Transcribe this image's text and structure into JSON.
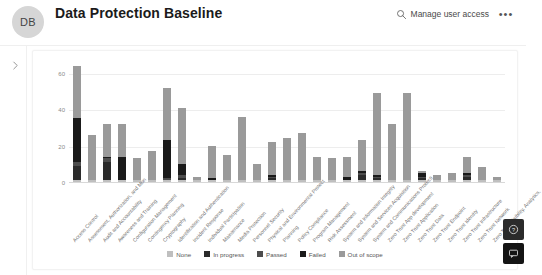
{
  "header": {
    "avatar_initials": "DB",
    "title": "Data Protection Baseline",
    "manage_access_label": "Manage user access",
    "manage_access_icon": "search-icon",
    "more_label": "•••"
  },
  "rail": {
    "expand_icon": "chevron-right-icon"
  },
  "floating": {
    "help_icon": "help-icon",
    "feedback_icon": "feedback-icon"
  },
  "colors": {
    "none": "#bfbfbf",
    "in_progress": "#2b2b2b",
    "passed": "#4d4d4d",
    "failed": "#1a1a1a",
    "out_of_scope": "#9a9a9a",
    "grid": "#ededed",
    "axis": "#d8d8d8",
    "text": "#6f6f6f"
  },
  "chart_data": {
    "type": "bar",
    "subtype": "stacked",
    "title": "",
    "xlabel": "",
    "ylabel": "",
    "ylim": [
      0,
      65
    ],
    "yticks": [
      0,
      20,
      40,
      60
    ],
    "grid": true,
    "legend_position": "bottom",
    "legend": [
      "None",
      "In progress",
      "Passed",
      "Failed",
      "Out of scope"
    ],
    "categories": [
      "Access Control",
      "Assessment, Authorization, and Monitoring",
      "Audit and Accountability",
      "Awareness and Training",
      "Configuration Management",
      "Contingency Planning",
      "Cryptography",
      "Identification and Authentication",
      "Incident Response",
      "Individual Participation",
      "Maintenance",
      "Media Protection",
      "Personnel Security",
      "Physical and Environmental Protection",
      "Planning",
      "Policy Compliance",
      "Program Management",
      "Risk Assessment",
      "System and Information Integrity",
      "System and Services Acquisition",
      "System and Communications Protection",
      "Zero Trust App development",
      "Zero Trust Application",
      "Zero Trust Data",
      "Zero Trust Endpoint",
      "Zero Trust Identity",
      "Zero Trust Infrastructure",
      "Zero Trust Network",
      "Zero Trust Visibility, Analytics, and Automation"
    ],
    "series": [
      {
        "name": "None",
        "color": "#bfbfbf",
        "values": [
          1,
          1,
          1,
          1,
          1,
          1,
          1,
          1,
          1,
          1,
          1,
          1,
          1,
          1,
          1,
          1,
          1,
          1,
          1,
          1,
          1,
          1,
          1,
          1,
          1,
          1,
          1,
          1,
          1
        ]
      },
      {
        "name": "In progress",
        "color": "#2b2b2b",
        "values": [
          8,
          0,
          10,
          0,
          0,
          0,
          0,
          1,
          0,
          0,
          0,
          0,
          0,
          1,
          0,
          0,
          0,
          0,
          0,
          3,
          1,
          0,
          0,
          1,
          0,
          0,
          2,
          0,
          0
        ]
      },
      {
        "name": "Passed",
        "color": "#4d4d4d",
        "values": [
          2,
          0,
          2,
          0,
          0,
          0,
          1,
          2,
          0,
          0,
          0,
          0,
          0,
          1,
          0,
          0,
          0,
          0,
          0,
          1,
          1,
          0,
          0,
          1,
          0,
          0,
          1,
          0,
          0
        ]
      },
      {
        "name": "Failed",
        "color": "#1a1a1a",
        "values": [
          24,
          0,
          1,
          13,
          0,
          0,
          21,
          6,
          0,
          1,
          0,
          0,
          0,
          1,
          0,
          0,
          0,
          0,
          2,
          1,
          1,
          0,
          0,
          2,
          0,
          0,
          1,
          0,
          0
        ]
      },
      {
        "name": "Out of scope",
        "color": "#9a9a9a",
        "values": [
          29,
          25,
          18,
          18,
          12,
          16,
          29,
          31,
          2,
          18,
          14,
          35,
          9,
          18,
          23,
          26,
          13,
          12,
          11,
          17,
          45,
          31,
          48,
          1,
          3,
          4,
          9,
          7,
          2
        ]
      }
    ]
  }
}
